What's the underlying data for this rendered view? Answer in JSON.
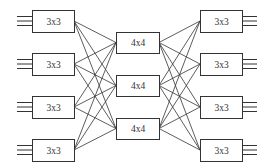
{
  "diagram": {
    "type": "three-stage Clos switching network",
    "stages": [
      {
        "name": "ingress",
        "boxes": [
          {
            "label": "3x3",
            "x": 32,
            "y": 10,
            "w": 42,
            "h": 22
          },
          {
            "label": "3x3",
            "x": 32,
            "y": 53,
            "w": 42,
            "h": 22
          },
          {
            "label": "3x3",
            "x": 32,
            "y": 96,
            "w": 42,
            "h": 22
          },
          {
            "label": "3x3",
            "x": 32,
            "y": 139,
            "w": 42,
            "h": 22
          }
        ]
      },
      {
        "name": "middle",
        "boxes": [
          {
            "label": "4x4",
            "x": 116,
            "y": 32,
            "w": 43,
            "h": 21
          },
          {
            "label": "4x4",
            "x": 116,
            "y": 75,
            "w": 43,
            "h": 21
          },
          {
            "label": "4x4",
            "x": 116,
            "y": 118,
            "w": 43,
            "h": 21
          }
        ]
      },
      {
        "name": "egress",
        "boxes": [
          {
            "label": "3x3",
            "x": 200,
            "y": 10,
            "w": 42,
            "h": 22
          },
          {
            "label": "3x3",
            "x": 200,
            "y": 53,
            "w": 42,
            "h": 22
          },
          {
            "label": "3x3",
            "x": 200,
            "y": 96,
            "w": 42,
            "h": 22
          },
          {
            "label": "3x3",
            "x": 200,
            "y": 139,
            "w": 42,
            "h": 22
          }
        ]
      }
    ],
    "io_lines_per_box": 3,
    "io_line_length": 15,
    "connection": "full mesh between adjacent stages",
    "colors": {
      "stroke": "#333333",
      "background": "#ffffff",
      "text": "#333333"
    }
  }
}
